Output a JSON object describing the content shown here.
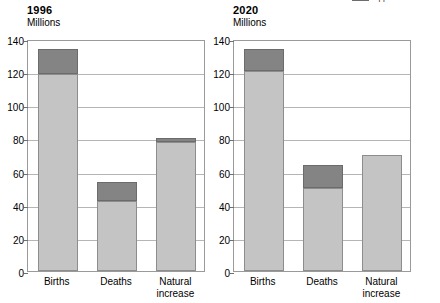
{
  "legend": {
    "items": [
      {
        "label": "Excess of deaths",
        "color": "#848484",
        "icon": "legend-swatch"
      }
    ]
  },
  "chart_data": {
    "type": "bar",
    "title": "",
    "subtitle": "",
    "xlabel": "",
    "ylabel": "Millions",
    "ylim": [
      0,
      140
    ],
    "ytick_step": 20,
    "ytick_labels": [
      "0",
      "20",
      "40",
      "60",
      "80",
      "100",
      "120",
      "140"
    ],
    "grid": true,
    "stacked": true,
    "legend_position": "top-right",
    "categories": [
      "Births",
      "Deaths",
      "Natural increase"
    ],
    "panels": [
      {
        "name": "1996",
        "title": "1996",
        "unit": "Millions",
        "series": [
          {
            "name": "lower",
            "color": "#c4c4c4",
            "values": [
              119,
              42,
              78
            ]
          },
          {
            "name": "upper",
            "color": "#848484",
            "values": [
              15,
              12,
              2
            ]
          }
        ],
        "totals": [
          134,
          54,
          80
        ]
      },
      {
        "name": "2020",
        "title": "2020",
        "unit": "Millions",
        "series": [
          {
            "name": "lower",
            "color": "#c4c4c4",
            "values": [
              121,
              50,
              70
            ]
          },
          {
            "name": "upper",
            "color": "#848484",
            "values": [
              13,
              14,
              0
            ]
          }
        ],
        "totals": [
          134,
          64,
          70
        ]
      }
    ]
  }
}
